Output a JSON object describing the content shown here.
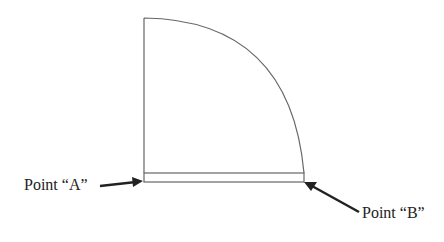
{
  "diagram": {
    "labels": {
      "point_a": "Point “A”",
      "point_b": "Point “B”"
    },
    "shape": "quarter-circle door swing with threshold",
    "colors": {
      "stroke": "#666666",
      "arrow": "#222222",
      "background": "#ffffff"
    }
  }
}
